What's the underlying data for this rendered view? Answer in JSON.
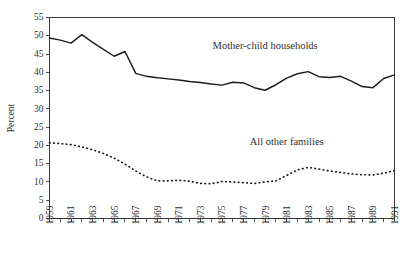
{
  "chart_data": {
    "type": "line",
    "title": "",
    "xlabel": "",
    "ylabel": "Percent",
    "xlim": [
      1959,
      1991
    ],
    "ylim": [
      0,
      55
    ],
    "ytick_step": 5,
    "xtick_step": 1,
    "xlabel_step": 2,
    "grid": false,
    "legend_position": "inline-annotation",
    "yticks": [
      0,
      5,
      10,
      15,
      20,
      25,
      30,
      35,
      40,
      45,
      50,
      55
    ],
    "ytick_labels": [
      "0",
      "5",
      "10",
      "15",
      "20",
      "25",
      "30",
      "35",
      "40",
      "45",
      "50",
      "55"
    ],
    "x": [
      1959,
      1960,
      1961,
      1962,
      1963,
      1964,
      1965,
      1966,
      1967,
      1968,
      1969,
      1970,
      1971,
      1972,
      1973,
      1974,
      1975,
      1976,
      1977,
      1978,
      1979,
      1980,
      1981,
      1982,
      1983,
      1984,
      1985,
      1986,
      1987,
      1988,
      1989,
      1990,
      1991
    ],
    "xtick_labels": [
      "1959",
      "1961",
      "1963",
      "1965",
      "1967",
      "1969",
      "1971",
      "1973",
      "1975",
      "1977",
      "1979",
      "1981",
      "1983",
      "1985",
      "1987",
      "1989",
      "1991"
    ],
    "xtick_label_years": [
      1959,
      1961,
      1963,
      1965,
      1967,
      1969,
      1971,
      1973,
      1975,
      1977,
      1979,
      1981,
      1983,
      1985,
      1987,
      1989,
      1991
    ],
    "series": [
      {
        "name": "Mother-child households",
        "style": "solid",
        "color": "#1d1d1f",
        "label_x": 1979,
        "label_y": 46.5,
        "values": [
          49.4,
          48.8,
          48.0,
          50.3,
          48.2,
          46.3,
          44.4,
          45.7,
          39.7,
          38.9,
          38.5,
          38.2,
          37.9,
          37.5,
          37.2,
          36.8,
          36.5,
          37.3,
          37.1,
          35.8,
          35.1,
          36.6,
          38.4,
          39.6,
          40.2,
          38.8,
          38.6,
          38.9,
          37.6,
          36.1,
          35.8,
          38.3,
          39.3
        ]
      },
      {
        "name": "All other families",
        "style": "dotted",
        "color": "#1d1d1f",
        "label_x": 1981,
        "label_y": 20.0,
        "values": [
          20.7,
          20.5,
          20.2,
          19.6,
          18.8,
          17.8,
          16.5,
          14.9,
          13.0,
          11.4,
          10.3,
          10.3,
          10.5,
          10.2,
          9.6,
          9.5,
          10.1,
          10.0,
          9.8,
          9.6,
          10.0,
          10.3,
          11.8,
          13.3,
          14.0,
          13.5,
          13.0,
          12.6,
          12.2,
          12.0,
          11.9,
          12.4,
          13.1
        ]
      }
    ]
  },
  "figure": {
    "background_color": "#ffffff",
    "axis_color": "#39393b",
    "text_color": "#2f2f31"
  }
}
